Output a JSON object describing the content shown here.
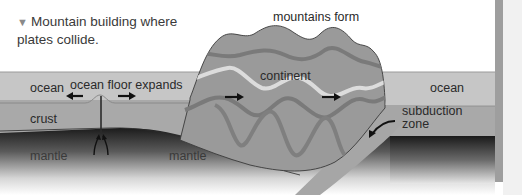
{
  "figure": {
    "caption_marker": "▼",
    "caption_line1": "Mountain building where",
    "caption_line2": "plates collide.",
    "labels": {
      "mountains_form": "mountains form",
      "ocean_left": "ocean",
      "ocean_floor_expands": "ocean floor expands",
      "continent": "continent",
      "ocean_right": "ocean",
      "subduction_zone_line1": "subduction",
      "subduction_zone_line2": "zone",
      "crust": "crust",
      "mantle_left": "mantle",
      "mantle_center": "mantle"
    },
    "colors": {
      "ocean": "#c4c4c4",
      "crust": "#a9a9a9",
      "continent": "#9a9a9a",
      "continent_band_dark": "#7c7c7c",
      "continent_band_light": "#d8d8d8",
      "mantle_top": "#1e1e1e",
      "mantle_bottom": "#ffffff",
      "slab": "#a6a6a6",
      "edge_bar": "#9e9e9e"
    }
  }
}
